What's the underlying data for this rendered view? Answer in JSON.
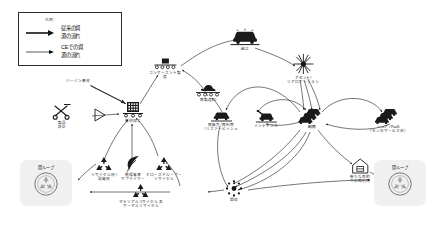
{
  "diagram": {
    "background_color": "#ffffff",
    "stroke_color": "#2b2b2b",
    "icon_dark": "#1a1a1a",
    "loopbox_bg": "#f0f0f0"
  },
  "legend": {
    "caption": "凡例:",
    "items": [
      {
        "label": "従来の資\n源の流れ",
        "arrow": "thick-arrow",
        "weight": "bold"
      },
      {
        "label": "CEでの資\n源の流れ",
        "arrow": "thin-arrow",
        "weight": "normal"
      }
    ]
  },
  "nodes": {
    "virgin_material": {
      "label": "バージン素材",
      "icon": "text-only"
    },
    "product_design": {
      "label": "製品\n設計",
      "icon": "design-tools-icon"
    },
    "material_processing": {
      "label": "素材加工",
      "icon": "factory-icon"
    },
    "component_manufacturing": {
      "label": "コンポーネント製\n造",
      "icon": "conveyor-icon"
    },
    "assembly": {
      "label": "組立",
      "icon": "car-assembly-icon"
    },
    "remanufacturing": {
      "label": "再製造2.0",
      "icon": "remanufacture-icon"
    },
    "asset_reallocation": {
      "label": "アセット/\nリアロケーション",
      "icon": "starburst-icon"
    },
    "resale_reuse_refurbish": {
      "label": "再販売 / 再利用\n/ リファービッシュ",
      "icon": "car-side-icon"
    },
    "maintenance": {
      "label": "メンテナンス",
      "icon": "car-maintenance-icon"
    },
    "usage": {
      "label": "利用",
      "icon": "car-stack-icon"
    },
    "share_paas": {
      "label": "シェア / PaaS\n（モノのサービス化）",
      "icon": "car-fleet-icon"
    },
    "collection": {
      "label": "回収",
      "icon": "collection-hub-icon"
    },
    "recycled_material": {
      "label": "リサイクル材 /\n副資材",
      "icon": "recycle-icon"
    },
    "circular_supplier": {
      "label": "循環資源\nサプライヤー",
      "icon": "leaf-icon"
    },
    "closed_loop_recycle": {
      "label": "クローズドループ・\nリサイクル",
      "icon": "recycle-icon"
    },
    "material_thermal_recycle": {
      "label": "マテリアルリサイクル 及\nサーマルリサイクル",
      "icon": "recycle-icon"
    },
    "repurpose": {
      "label": "新たな目的\nでの再利用",
      "icon": "house-icon"
    },
    "residue": {
      "label": "残渣物",
      "icon": "text-only"
    }
  },
  "loop_boxes": [
    {
      "id": "open-loop-left",
      "title": "開ループ",
      "icon": "globe-recycle-icon"
    },
    {
      "id": "open-loop-right",
      "title": "開ループ",
      "icon": "globe-recycle-icon"
    }
  ]
}
